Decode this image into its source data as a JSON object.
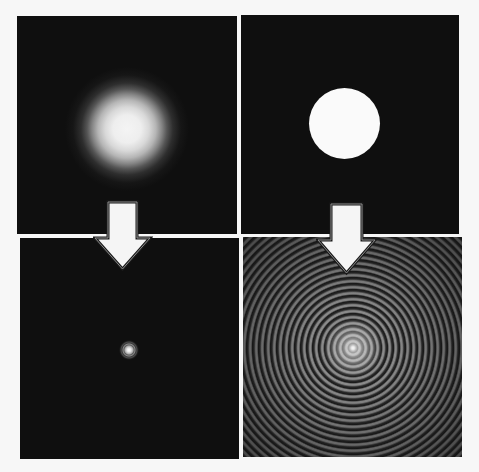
{
  "figure": {
    "panels": [
      {
        "id": "top-left",
        "content": "gaussian-blob",
        "caption": ""
      },
      {
        "id": "top-right",
        "content": "circular-disk",
        "caption": ""
      },
      {
        "id": "bottom-left",
        "content": "narrow-gaussian-spot",
        "caption": ""
      },
      {
        "id": "bottom-right",
        "content": "airy-pattern-rings",
        "caption": ""
      }
    ],
    "arrows": [
      {
        "id": "arrow-left",
        "direction": "down",
        "from": "top-left",
        "to": "bottom-left"
      },
      {
        "id": "arrow-right",
        "direction": "down",
        "from": "top-right",
        "to": "bottom-right"
      }
    ],
    "colors": {
      "background": "#f7f7f7",
      "panel": "#0f0f0f",
      "highlight": "#fafafa",
      "arrow_fill": "#f5f5f5",
      "arrow_stroke": "#1a1a1a"
    }
  }
}
